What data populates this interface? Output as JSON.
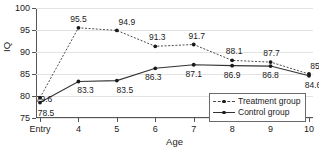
{
  "chart_data": {
    "type": "line",
    "title": "",
    "xlabel": "Age",
    "ylabel": "IQ",
    "categories": [
      "Entry",
      "4",
      "5",
      "6",
      "7",
      "8",
      "9",
      "10"
    ],
    "ylim": [
      75,
      100
    ],
    "yticks": [
      75,
      80,
      85,
      90,
      95,
      100
    ],
    "grid": true,
    "legend_position": "bottom-right",
    "series": [
      {
        "name": "Treatment group",
        "style": "dotted",
        "marker": "circle",
        "values": [
          79.6,
          95.5,
          94.9,
          91.3,
          91.7,
          88.1,
          87.7,
          85
        ],
        "labels": [
          "79.6",
          "95.5",
          "94.9",
          "91.3",
          "91.7",
          "88.1",
          "87.7",
          "85"
        ]
      },
      {
        "name": "Control group",
        "style": "solid",
        "marker": "circle",
        "values": [
          78.5,
          83.3,
          83.5,
          86.3,
          87.1,
          86.9,
          86.8,
          84.6
        ],
        "labels": [
          "78.5",
          "83.3",
          "83.5",
          "86.3",
          "87.1",
          "86.9",
          "86.8",
          "84.6"
        ]
      }
    ]
  },
  "axes": {
    "y_tick_labels": [
      "100",
      "95",
      "90",
      "85",
      "80",
      "75"
    ],
    "x_tick_labels": [
      "Entry",
      "4",
      "5",
      "6",
      "7",
      "8",
      "9",
      "10"
    ],
    "y_axis_title": "IQ",
    "x_axis_title": "Age"
  },
  "legend": {
    "items": [
      {
        "label": "Treatment group"
      },
      {
        "label": "Control group"
      }
    ]
  },
  "colors": {
    "treatment_line": "#4d4d4d",
    "control_line": "#333333",
    "grid": "#e3e3e3",
    "axis": "#555555",
    "background": "#ffffff"
  }
}
